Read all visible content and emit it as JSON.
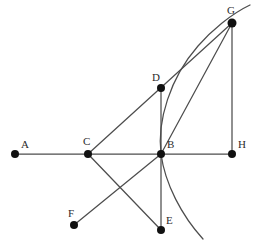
{
  "figure": {
    "type": "geometry-diagram",
    "title": "",
    "background_color": "#ffffff",
    "stroke_color": "#4d4d4d",
    "vertex_color": "#111111",
    "label_color": "#2b2b2b",
    "width": 255,
    "height": 250,
    "points": [
      {
        "id": "A",
        "label": "A",
        "x": 15,
        "y": 154,
        "label_x": 21,
        "label_y": 148
      },
      {
        "id": "B",
        "label": "B",
        "x": 161,
        "y": 154,
        "label_x": 167,
        "label_y": 148
      },
      {
        "id": "C",
        "label": "C",
        "x": 88,
        "y": 154,
        "label_x": 83,
        "label_y": 145
      },
      {
        "id": "D",
        "label": "D",
        "x": 161,
        "y": 88,
        "label_x": 152,
        "label_y": 81
      },
      {
        "id": "E",
        "label": "E",
        "x": 161,
        "y": 230,
        "label_x": 166,
        "label_y": 224
      },
      {
        "id": "F",
        "label": "F",
        "x": 74,
        "y": 225,
        "label_x": 68,
        "label_y": 217
      },
      {
        "id": "G",
        "label": "G",
        "x": 232,
        "y": 23,
        "label_x": 227,
        "label_y": 14
      },
      {
        "id": "H",
        "label": "H",
        "x": 232,
        "y": 154,
        "label_x": 238,
        "label_y": 148
      }
    ],
    "segments": [
      {
        "id": "A-H",
        "from": "A",
        "to": "H",
        "description": "horizontal baseline through C and B"
      },
      {
        "id": "C-G",
        "from": "C",
        "to": "G",
        "description": "line from C up-right through D to G"
      },
      {
        "id": "D-E",
        "from": "D",
        "to": "E",
        "description": "vertical line from D through B to E"
      },
      {
        "id": "B-G",
        "from": "B",
        "to": "G",
        "description": "line from B up-right to G"
      },
      {
        "id": "G-H",
        "from": "G",
        "to": "H",
        "description": "vertical right side"
      },
      {
        "id": "B-F",
        "from": "B",
        "to": "F",
        "description": "line from B down-left to F"
      },
      {
        "id": "C-E",
        "from": "C",
        "to": "E",
        "description": "line from C down-right to E"
      }
    ],
    "curve": {
      "id": "parabola-through-B",
      "description": "smooth arc with vertical tangent at B, opening rightward, passing through G and extending beyond both ends",
      "passes_through": [
        "B",
        "G"
      ],
      "path": "M 203 239 C 182 216 165 184 161 154 C 157 121 170 78 198 46 C 211 31 231 14 250 5"
    }
  }
}
